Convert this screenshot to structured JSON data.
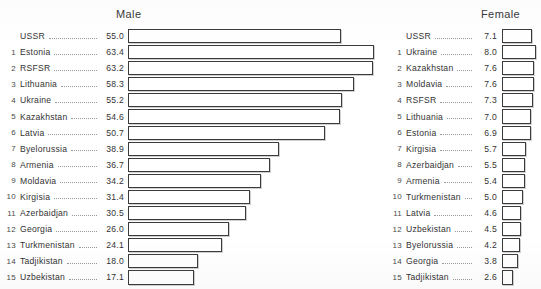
{
  "figure": {
    "type": "grouped-horizontal-bar",
    "left_panel_title": "Male",
    "right_panel_title": "Female"
  },
  "male": {
    "title": "Male",
    "rows": [
      {
        "index": "",
        "name": "USSR",
        "value": "55.0"
      },
      {
        "index": "1",
        "name": "Estonia",
        "value": "63.4"
      },
      {
        "index": "2",
        "name": "RSFSR",
        "value": "63.2"
      },
      {
        "index": "3",
        "name": "Lithuania",
        "value": "58.3"
      },
      {
        "index": "4",
        "name": "Ukraine",
        "value": "55.2"
      },
      {
        "index": "5",
        "name": "Kazakhstan",
        "value": "54.6"
      },
      {
        "index": "6",
        "name": "Latvia",
        "value": "50.7"
      },
      {
        "index": "7",
        "name": "Byelorussia",
        "value": "38.9"
      },
      {
        "index": "8",
        "name": "Armenia",
        "value": "36.7"
      },
      {
        "index": "9",
        "name": "Moldavia",
        "value": "34.2"
      },
      {
        "index": "10",
        "name": "Kirgisia",
        "value": "31.4"
      },
      {
        "index": "11",
        "name": "Azerbaidjan",
        "value": "30.5"
      },
      {
        "index": "12",
        "name": "Georgia",
        "value": "26.0"
      },
      {
        "index": "13",
        "name": "Turkmenistan",
        "value": "24.1"
      },
      {
        "index": "14",
        "name": "Tadjikistan",
        "value": "18.0"
      },
      {
        "index": "15",
        "name": "Uzbekistan",
        "value": "17.1"
      }
    ]
  },
  "female": {
    "title": "Female",
    "rows": [
      {
        "index": "",
        "name": "USSR",
        "value": "7.1"
      },
      {
        "index": "1",
        "name": "Ukraine",
        "value": "8.0"
      },
      {
        "index": "2",
        "name": "Kazakhstan",
        "value": "7.6"
      },
      {
        "index": "3",
        "name": "Moldavia",
        "value": "7.6"
      },
      {
        "index": "4",
        "name": "RSFSR",
        "value": "7.3"
      },
      {
        "index": "5",
        "name": "Lithuania",
        "value": "7.0"
      },
      {
        "index": "6",
        "name": "Estonia",
        "value": "6.9"
      },
      {
        "index": "7",
        "name": "Kirgisia",
        "value": "5.7"
      },
      {
        "index": "8",
        "name": "Azerbaidjan",
        "value": "5.5"
      },
      {
        "index": "9",
        "name": "Armenia",
        "value": "5.4"
      },
      {
        "index": "10",
        "name": "Turkmenistan",
        "value": "5.0"
      },
      {
        "index": "11",
        "name": "Latvia",
        "value": "4.6"
      },
      {
        "index": "12",
        "name": "Uzbekistan",
        "value": "4.5"
      },
      {
        "index": "13",
        "name": "Byelorussia",
        "value": "4.2"
      },
      {
        "index": "14",
        "name": "Georgia",
        "value": "3.8"
      },
      {
        "index": "15",
        "name": "Tadjikistan",
        "value": "2.6"
      }
    ]
  },
  "chart_data": [
    {
      "type": "bar",
      "orientation": "horizontal",
      "title": "Male",
      "xlabel": "",
      "ylabel": "",
      "grid": false,
      "legend": "none",
      "xlim": [
        0,
        65
      ],
      "bar_style": "outlined-white-with-drop-shadow",
      "categories": [
        "USSR",
        "Estonia",
        "RSFSR",
        "Lithuania",
        "Ukraine",
        "Kazakhstan",
        "Latvia",
        "Byelorussia",
        "Armenia",
        "Moldavia",
        "Kirgisia",
        "Azerbaidjan",
        "Georgia",
        "Turkmenistan",
        "Tadjikistan",
        "Uzbekistan"
      ],
      "rank_labels": [
        "",
        "1",
        "2",
        "3",
        "4",
        "5",
        "6",
        "7",
        "8",
        "9",
        "10",
        "11",
        "12",
        "13",
        "14",
        "15"
      ],
      "values": [
        55.0,
        63.4,
        63.2,
        58.3,
        55.2,
        54.6,
        50.7,
        38.9,
        36.7,
        34.2,
        31.4,
        30.5,
        26.0,
        24.1,
        18.0,
        17.1
      ]
    },
    {
      "type": "bar",
      "orientation": "horizontal",
      "title": "Female",
      "xlabel": "",
      "ylabel": "",
      "grid": false,
      "legend": "none",
      "xlim": [
        0,
        9
      ],
      "bar_style": "outlined-white-with-drop-shadow",
      "categories": [
        "USSR",
        "Ukraine",
        "Kazakhstan",
        "Moldavia",
        "RSFSR",
        "Lithuania",
        "Estonia",
        "Kirgisia",
        "Azerbaidjan",
        "Armenia",
        "Turkmenistan",
        "Latvia",
        "Uzbekistan",
        "Byelorussia",
        "Georgia",
        "Tadjikistan"
      ],
      "rank_labels": [
        "",
        "1",
        "2",
        "3",
        "4",
        "5",
        "6",
        "7",
        "8",
        "9",
        "10",
        "11",
        "12",
        "13",
        "14",
        "15"
      ],
      "values": [
        7.1,
        8.0,
        7.6,
        7.6,
        7.3,
        7.0,
        6.9,
        5.7,
        5.5,
        5.4,
        5.0,
        4.6,
        4.5,
        4.2,
        3.8,
        2.6
      ]
    }
  ],
  "scale": {
    "male_px_per_unit": 3.88,
    "female_px_per_unit": 4.2
  }
}
